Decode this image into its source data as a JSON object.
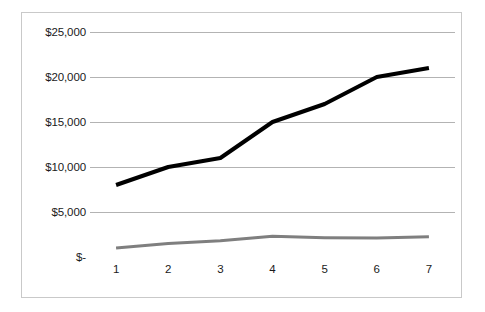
{
  "chart_data": {
    "type": "line",
    "title": "",
    "subtitle": "",
    "xlabel": "",
    "ylabel": "",
    "x": [
      1,
      2,
      3,
      4,
      5,
      6,
      7
    ],
    "categories": [
      "1",
      "2",
      "3",
      "4",
      "5",
      "6",
      "7"
    ],
    "xtick_labels": [
      "1",
      "2",
      "3",
      "4",
      "5",
      "6",
      "7"
    ],
    "ytick_labels": [
      "$25,000",
      "$20,000",
      "$15,000",
      "$10,000",
      "$5,000",
      "$-"
    ],
    "ytick_values": [
      25000,
      20000,
      15000,
      10000,
      5000,
      0
    ],
    "ylim": [
      0,
      25000
    ],
    "grid": "horizontal",
    "legend": "none",
    "series": [
      {
        "name": "series-1",
        "color": "#000000",
        "width": 4,
        "values": [
          8000,
          10000,
          11000,
          15000,
          17000,
          20000,
          21000
        ]
      },
      {
        "name": "series-2",
        "color": "#7f7f7f",
        "width": 3,
        "values": [
          1000,
          1500,
          1800,
          2300,
          2150,
          2100,
          2250
        ]
      }
    ],
    "colors": {
      "background": "#ffffff",
      "frame_border": "#c9c9c9",
      "gridline": "#b3b3b3",
      "axis_line": "#9a9a9a",
      "tick_label": "#1a1a1a"
    }
  }
}
